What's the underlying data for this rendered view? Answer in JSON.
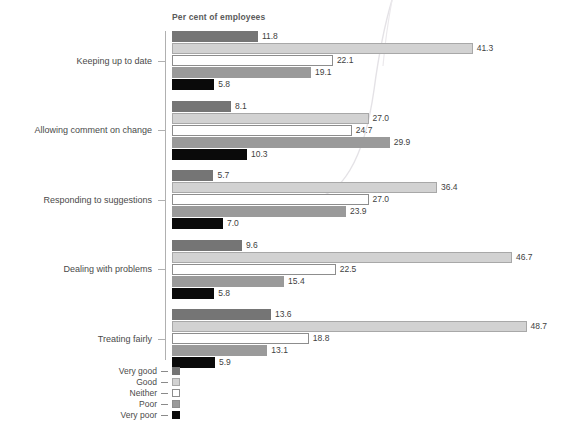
{
  "chart_data": {
    "type": "bar",
    "orientation": "horizontal",
    "title": "Per cent of employees",
    "xlabel": "Per cent of employees",
    "ylabel": "",
    "xlim": [
      0,
      50
    ],
    "grid": false,
    "legend_position": "bottom-left",
    "categories": [
      "Keeping up to date",
      "Allowing comment on change",
      "Responding to suggestions",
      "Dealing with problems",
      "Treating fairly"
    ],
    "series": [
      {
        "name": "Very good",
        "color": "#757575",
        "values": [
          11.8,
          8.1,
          5.7,
          9.6,
          13.6
        ]
      },
      {
        "name": "Good",
        "color": "#d2d2d2",
        "values": [
          41.3,
          27.0,
          36.4,
          46.7,
          48.7
        ]
      },
      {
        "name": "Neither",
        "color": "#ffffff",
        "values": [
          22.1,
          24.7,
          27.0,
          22.5,
          18.8
        ]
      },
      {
        "name": "Poor",
        "color": "#9a9a9a",
        "values": [
          19.1,
          29.9,
          23.9,
          15.4,
          13.1
        ]
      },
      {
        "name": "Very poor",
        "color": "#0a0a0a",
        "values": [
          5.8,
          10.3,
          7.0,
          5.8,
          5.9
        ]
      }
    ],
    "value_labels": [
      [
        "11.8",
        "41.3",
        "22.1",
        "19.1",
        "5.8"
      ],
      [
        "8.1",
        "27.0",
        "24.7",
        "29.9",
        "10.3"
      ],
      [
        "5.7",
        "36.4",
        "27.0",
        "23.9",
        "7.0"
      ],
      [
        "9.6",
        "46.7",
        "22.5",
        "15.4",
        "5.8"
      ],
      [
        "13.6",
        "48.7",
        "18.8",
        "13.1",
        "5.9"
      ]
    ]
  },
  "legend": {
    "items": [
      {
        "label": "Very good"
      },
      {
        "label": "Good"
      },
      {
        "label": "Neither"
      },
      {
        "label": "Poor"
      },
      {
        "label": "Very poor"
      }
    ]
  },
  "colors": {
    "very_good": "#757575",
    "good": "#d2d2d2",
    "neither": "#ffffff",
    "poor": "#9a9a9a",
    "very_poor": "#0a0a0a",
    "axis": "#b0b0b0",
    "text": "#4a4a4a",
    "title_text": "#5b5b5b"
  }
}
